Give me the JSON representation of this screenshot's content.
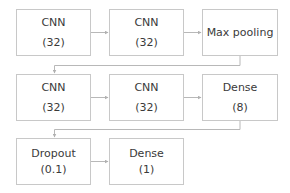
{
  "diagram": {
    "title": "",
    "colors": {
      "border": "#c8c8c8",
      "line": "#b0b0b0",
      "text": "#3a3a3a"
    },
    "rows": [
      {
        "nodes": [
          {
            "id": "cnn1",
            "line1": "CNN",
            "line2": "(32)"
          },
          {
            "id": "cnn2",
            "line1": "CNN",
            "line2": "(32)"
          },
          {
            "id": "maxpool",
            "line1": "Max pooling",
            "line2": ""
          }
        ]
      },
      {
        "nodes": [
          {
            "id": "cnn3",
            "line1": "CNN",
            "line2": "(32)"
          },
          {
            "id": "cnn4",
            "line1": "CNN",
            "line2": "(32)"
          },
          {
            "id": "dense8",
            "line1": "Dense",
            "line2": "(8)"
          }
        ]
      },
      {
        "nodes": [
          {
            "id": "dropout",
            "line1": "Dropout",
            "line2": "(0.1)"
          },
          {
            "id": "dense1",
            "line1": "Dense",
            "line2": "(1)"
          }
        ]
      }
    ],
    "edges": [
      {
        "from": "cnn1",
        "to": "cnn2"
      },
      {
        "from": "cnn2",
        "to": "maxpool"
      },
      {
        "from": "maxpool",
        "to": "cnn3"
      },
      {
        "from": "cnn3",
        "to": "cnn4"
      },
      {
        "from": "cnn4",
        "to": "dense8"
      },
      {
        "from": "dense8",
        "to": "dropout"
      },
      {
        "from": "dropout",
        "to": "dense1"
      }
    ]
  }
}
